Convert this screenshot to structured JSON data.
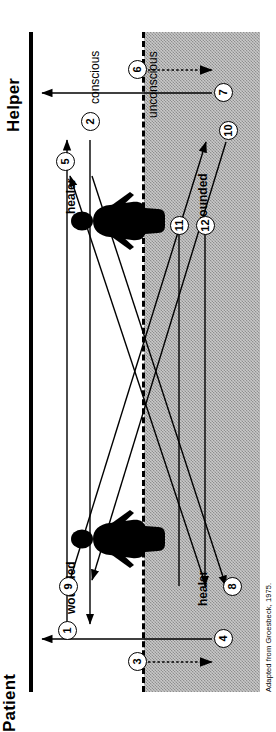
{
  "figure": {
    "title_left": "Patient",
    "title_right": "Helper",
    "attribution": "Adapted from Groesbeck, 1975.",
    "axis_labels": {
      "conscious": "conscious",
      "unconscious": "unconscious"
    },
    "roles": {
      "patient_conscious": "wounded",
      "patient_unconscious": "healer",
      "helper_conscious": "healer",
      "helper_unconscious": "wounded"
    },
    "figures": [
      {
        "name": "patient-silhouette",
        "side": "patient"
      },
      {
        "name": "helper-silhouette",
        "side": "helper"
      }
    ],
    "arrow_numbers": [
      "1",
      "2",
      "3",
      "4",
      "5",
      "6",
      "7",
      "8",
      "9",
      "10",
      "11",
      "12"
    ],
    "arrows": [
      {
        "id": "1",
        "label": "1",
        "style": "solid",
        "from": "patient-conscious",
        "to": "helper-conscious"
      },
      {
        "id": "2",
        "label": "2",
        "style": "solid",
        "from": "helper-conscious",
        "to": "patient-conscious"
      },
      {
        "id": "3",
        "label": "3",
        "style": "dotted",
        "from": "patient-conscious",
        "to": "patient-unconscious"
      },
      {
        "id": "4",
        "label": "4",
        "style": "solid",
        "from": "patient-unconscious",
        "to": "patient-conscious"
      },
      {
        "id": "5",
        "label": "5",
        "style": "solid",
        "from": "patient-unconscious",
        "to": "helper-conscious"
      },
      {
        "id": "6",
        "label": "6",
        "style": "solid",
        "from": "helper-conscious",
        "to": "helper-unconscious"
      },
      {
        "id": "7",
        "label": "7",
        "style": "dotted",
        "from": "helper-unconscious",
        "to": "helper-conscious"
      },
      {
        "id": "8",
        "label": "8",
        "style": "solid",
        "from": "helper-conscious",
        "to": "patient-unconscious"
      },
      {
        "id": "9",
        "label": "9",
        "style": "solid",
        "from": "patient-conscious",
        "to": "helper-unconscious"
      },
      {
        "id": "10",
        "label": "10",
        "style": "solid",
        "from": "helper-unconscious",
        "to": "patient-conscious"
      },
      {
        "id": "11",
        "label": "11",
        "style": "solid",
        "from": "patient-unconscious",
        "to": "helper-unconscious"
      },
      {
        "id": "12",
        "label": "12",
        "style": "solid",
        "from": "helper-unconscious",
        "to": "patient-unconscious"
      }
    ],
    "colors": {
      "ink": "#000000",
      "shaded_field": "#c9c9c9",
      "background": "#ffffff"
    }
  }
}
